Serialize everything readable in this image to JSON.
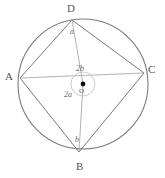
{
  "figure": {
    "type": "geometry-diagram",
    "colors": {
      "stroke": "#7a7a7a",
      "light_stroke": "#9b9b9b",
      "text": "#555555",
      "background": "#ffffff",
      "center_dot": "#111111"
    },
    "circle": {
      "center_x": 83,
      "center_y": 84,
      "radius": 65
    },
    "vertices": [
      {
        "name": "D",
        "label": "D",
        "x": 72,
        "y": 20
      },
      {
        "name": "A",
        "label": "A",
        "x": 20,
        "y": 78
      },
      {
        "name": "C",
        "label": "C",
        "x": 144,
        "y": 73
      },
      {
        "name": "B",
        "label": "B",
        "x": 79,
        "y": 152
      }
    ],
    "vertex_labels": {
      "D": "D",
      "A": "A",
      "C": "C",
      "B": "B"
    },
    "inscribed_angles": {
      "at_D": "a",
      "at_B": "b"
    },
    "central_angles": {
      "upper": "2b",
      "lower": "2a"
    },
    "center_point": {
      "label": "O",
      "x": 83,
      "y": 84
    },
    "arc_marker": {
      "radius": 12,
      "description": "small circle arc around centre O indicating central angles"
    },
    "segments": [
      {
        "name": "chord-AD",
        "from": "A",
        "to": "D"
      },
      {
        "name": "chord-DC",
        "from": "D",
        "to": "C"
      },
      {
        "name": "chord-CB",
        "from": "C",
        "to": "B"
      },
      {
        "name": "chord-BA",
        "from": "B",
        "to": "A"
      },
      {
        "name": "radius-OA",
        "from": "O",
        "to": "A"
      },
      {
        "name": "radius-OC",
        "from": "O",
        "to": "C"
      },
      {
        "name": "radius-OD",
        "from": "O",
        "to": "D"
      },
      {
        "name": "radius-OB",
        "from": "O",
        "to": "B"
      }
    ]
  }
}
